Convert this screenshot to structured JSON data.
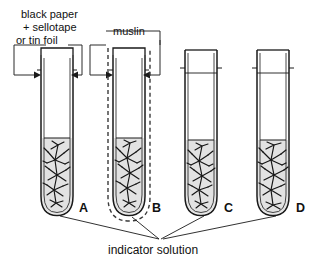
{
  "figure": {
    "background_color": "#ffffff",
    "ink_color": "#1a1a1a",
    "solution_color": "#e2e2e2"
  },
  "callouts": {
    "black_paper": {
      "line1": "black paper",
      "line2": "+ sellotape",
      "line3": "or tin foil"
    },
    "muslin": {
      "label": "muslin"
    }
  },
  "bottom_label": {
    "text": "indicator solution"
  },
  "tubes": [
    {
      "letter": "A",
      "covering": "black paper + sellotape or tin foil",
      "covering_style": "solid",
      "has_plant": true,
      "has_solution": true
    },
    {
      "letter": "B",
      "covering": "muslin",
      "covering_style": "dashed",
      "has_plant": true,
      "has_solution": true
    },
    {
      "letter": "C",
      "covering": "none",
      "covering_style": "none",
      "has_plant": true,
      "has_solution": true
    },
    {
      "letter": "D",
      "covering": "none",
      "covering_style": "none",
      "has_plant": true,
      "has_solution": true
    }
  ]
}
